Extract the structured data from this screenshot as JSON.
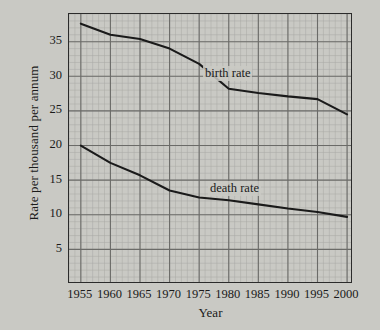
{
  "chart_data": {
    "type": "line",
    "title": "",
    "xlabel": "Year",
    "ylabel": "Rate per thousand per annum",
    "xlim": [
      1953,
      2001
    ],
    "ylim": [
      0,
      39
    ],
    "grid": true,
    "grid_major_x": 5,
    "grid_major_y": 5,
    "grid_minor_x": 1,
    "grid_minor_y": 1,
    "legend": "inline-annotations",
    "xticks": [
      "1955",
      "1960",
      "1965",
      "1970",
      "1975",
      "1980",
      "1985",
      "1990",
      "1995",
      "2000"
    ],
    "yticks": [
      "5",
      "10",
      "15",
      "20",
      "25",
      "30",
      "35"
    ],
    "x": [
      1955,
      1960,
      1965,
      1970,
      1975,
      1980,
      1985,
      1990,
      1995,
      2000
    ],
    "series": [
      {
        "name": "birth rate",
        "label": "birth rate",
        "color": "#1a1a1a",
        "values": [
          37.6,
          36.0,
          35.4,
          34.0,
          31.8,
          28.2,
          27.6,
          27.1,
          26.7,
          24.5
        ]
      },
      {
        "name": "death rate",
        "label": "death rate",
        "color": "#1a1a1a",
        "values": [
          20.0,
          17.5,
          15.7,
          13.5,
          12.5,
          12.1,
          11.5,
          10.9,
          10.4,
          9.7
        ]
      }
    ]
  },
  "annotations": {
    "birth_rate_label": "birth rate",
    "death_rate_label": "death rate"
  },
  "style": {
    "page_background": "#c9c9c4",
    "ink": "#1a1a1a",
    "grid_major": "#6b6b68",
    "grid_minor": "#a9a9a4"
  }
}
